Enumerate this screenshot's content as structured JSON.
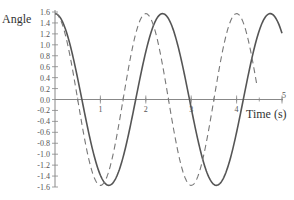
{
  "chart_data": {
    "type": "line",
    "title": "",
    "xlabel": "Time (s)",
    "ylabel": "Angle",
    "xlim": [
      0,
      5
    ],
    "ylim": [
      -1.6,
      1.6
    ],
    "x_ticks": [
      1,
      2,
      3,
      4,
      5
    ],
    "x_minor_step": 0.5,
    "y_ticks": [
      "1.6",
      "1.4",
      "1.2",
      "1.0",
      "0.8",
      "0.6",
      "0.4",
      "0.2",
      "0.0",
      "-0.2",
      "-0.4",
      "-0.6",
      "-0.8",
      "-1.0",
      "-1.2",
      "-1.4",
      "-1.6"
    ],
    "grid": false,
    "legend": null,
    "series": [
      {
        "name": "solid",
        "style": "solid",
        "color": "#555555",
        "amplitude": 1.57,
        "period": 2.37,
        "t_range": [
          0,
          5
        ],
        "x": [
          0,
          0.57,
          1.18,
          1.78,
          2.37,
          2.96,
          3.55,
          4.15,
          4.74,
          5.0
        ],
        "values": [
          1.57,
          0.0,
          -1.57,
          0.0,
          1.57,
          0.0,
          -1.57,
          0.0,
          1.57,
          1.22
        ]
      },
      {
        "name": "dashed",
        "style": "dashed",
        "color": "#777777",
        "amplitude": 1.57,
        "period": 2.0,
        "t_range": [
          0,
          4.45
        ],
        "x": [
          0,
          0.5,
          1.0,
          1.5,
          2.0,
          2.5,
          3.0,
          3.5,
          4.0,
          4.45
        ],
        "values": [
          1.57,
          0.0,
          -1.57,
          0.0,
          1.57,
          0.0,
          -1.57,
          0.0,
          1.57,
          -0.25
        ]
      }
    ]
  }
}
